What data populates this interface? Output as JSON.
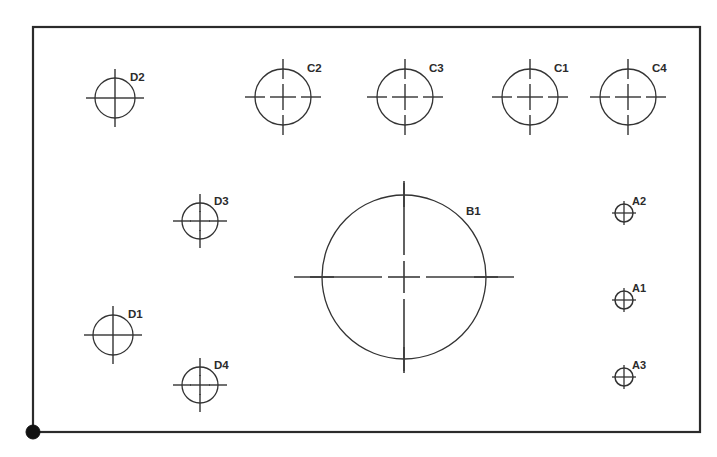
{
  "drawing": {
    "title": "Hole Pattern Layout",
    "background_color": "#ffffff",
    "line_color": "#333333",
    "frame_color": "#2b2b2b",
    "canvas": {
      "width": 717,
      "height": 457
    },
    "frame": {
      "name": "part-outline-rectangle",
      "x": 33,
      "y": 27,
      "width": 667,
      "height": 405
    },
    "origin_marker": {
      "name": "datum-origin-marker",
      "cx": 33,
      "cy": 432,
      "r": 7,
      "color": "#111111"
    },
    "holes": [
      {
        "label": "D2",
        "group": "D",
        "cx": 115,
        "cy": 98,
        "r": 20,
        "tick_overshoot": 9,
        "center_cross": 11,
        "label_dx": 15,
        "label_dy": -17,
        "size_class": "medium"
      },
      {
        "label": "C2",
        "group": "C",
        "cx": 283,
        "cy": 97,
        "r": 28,
        "tick_overshoot": 10,
        "center_cross": 13,
        "label_dx": 24,
        "label_dy": -25,
        "size_class": "large"
      },
      {
        "label": "C3",
        "group": "C",
        "cx": 405,
        "cy": 97,
        "r": 28,
        "tick_overshoot": 10,
        "center_cross": 13,
        "label_dx": 24,
        "label_dy": -25,
        "size_class": "large"
      },
      {
        "label": "C1",
        "group": "C",
        "cx": 530,
        "cy": 97,
        "r": 28,
        "tick_overshoot": 10,
        "center_cross": 13,
        "label_dx": 24,
        "label_dy": -25,
        "size_class": "large"
      },
      {
        "label": "C4",
        "group": "C",
        "cx": 628,
        "cy": 97,
        "r": 28,
        "tick_overshoot": 10,
        "center_cross": 13,
        "label_dx": 24,
        "label_dy": -25,
        "size_class": "large"
      },
      {
        "label": "D3",
        "group": "D",
        "cx": 200,
        "cy": 221,
        "r": 18,
        "tick_overshoot": 9,
        "center_cross": 10,
        "label_dx": 14,
        "label_dy": -16,
        "size_class": "medium"
      },
      {
        "label": "B1",
        "group": "B",
        "cx": 404,
        "cy": 277,
        "r": 82,
        "tick_overshoot": 12,
        "center_cross": 16,
        "label_dx": 62,
        "label_dy": -62,
        "size_class": "xlarge"
      },
      {
        "label": "D1",
        "group": "D",
        "cx": 113,
        "cy": 335,
        "r": 20,
        "tick_overshoot": 9,
        "center_cross": 11,
        "label_dx": 15,
        "label_dy": -17,
        "size_class": "medium"
      },
      {
        "label": "D4",
        "group": "D",
        "cx": 200,
        "cy": 385,
        "r": 18,
        "tick_overshoot": 9,
        "center_cross": 10,
        "label_dx": 14,
        "label_dy": -16,
        "size_class": "medium"
      },
      {
        "label": "A2",
        "group": "A",
        "cx": 624,
        "cy": 213,
        "r": 9,
        "tick_overshoot": 3,
        "center_cross": 9,
        "label_dx": 8,
        "label_dy": -8,
        "size_class": "small"
      },
      {
        "label": "A1",
        "group": "A",
        "cx": 624,
        "cy": 300,
        "r": 9,
        "tick_overshoot": 3,
        "center_cross": 9,
        "label_dx": 8,
        "label_dy": -8,
        "size_class": "small"
      },
      {
        "label": "A3",
        "group": "A",
        "cx": 624,
        "cy": 377,
        "r": 9,
        "tick_overshoot": 3,
        "center_cross": 9,
        "label_dx": 8,
        "label_dy": -8,
        "size_class": "small"
      }
    ]
  }
}
